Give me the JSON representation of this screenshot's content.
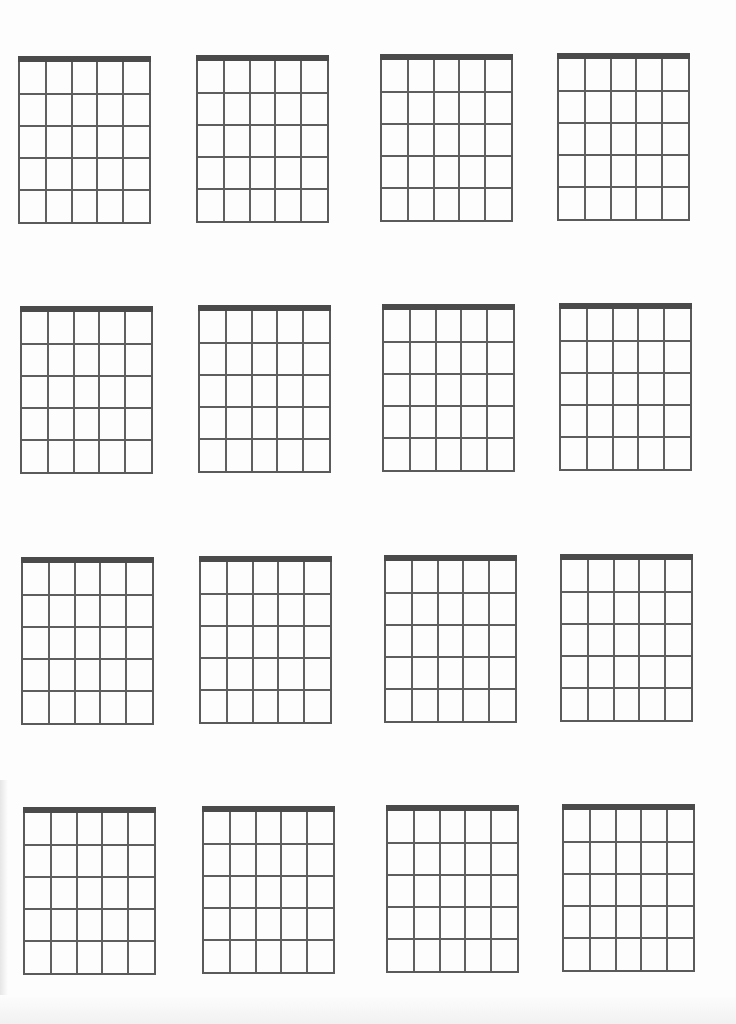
{
  "page": {
    "background": "#fdfdfd",
    "line_color": "#5a5a5a",
    "nut_color": "#4a4a4a"
  },
  "diagram_spec": {
    "strings": 6,
    "frets": 5,
    "has_nut": true,
    "width": 133,
    "height": 168
  },
  "diagrams": [
    {
      "row": 1,
      "col": 1,
      "x": 18,
      "y": 56
    },
    {
      "row": 1,
      "col": 2,
      "x": 196,
      "y": 55
    },
    {
      "row": 1,
      "col": 3,
      "x": 380,
      "y": 54
    },
    {
      "row": 1,
      "col": 4,
      "x": 557,
      "y": 53
    },
    {
      "row": 2,
      "col": 1,
      "x": 20,
      "y": 306
    },
    {
      "row": 2,
      "col": 2,
      "x": 198,
      "y": 305
    },
    {
      "row": 2,
      "col": 3,
      "x": 382,
      "y": 304
    },
    {
      "row": 2,
      "col": 4,
      "x": 559,
      "y": 303
    },
    {
      "row": 3,
      "col": 1,
      "x": 21,
      "y": 557
    },
    {
      "row": 3,
      "col": 2,
      "x": 199,
      "y": 556
    },
    {
      "row": 3,
      "col": 3,
      "x": 384,
      "y": 555
    },
    {
      "row": 3,
      "col": 4,
      "x": 560,
      "y": 554
    },
    {
      "row": 4,
      "col": 1,
      "x": 23,
      "y": 807
    },
    {
      "row": 4,
      "col": 2,
      "x": 202,
      "y": 806
    },
    {
      "row": 4,
      "col": 3,
      "x": 386,
      "y": 805
    },
    {
      "row": 4,
      "col": 4,
      "x": 562,
      "y": 804
    }
  ]
}
